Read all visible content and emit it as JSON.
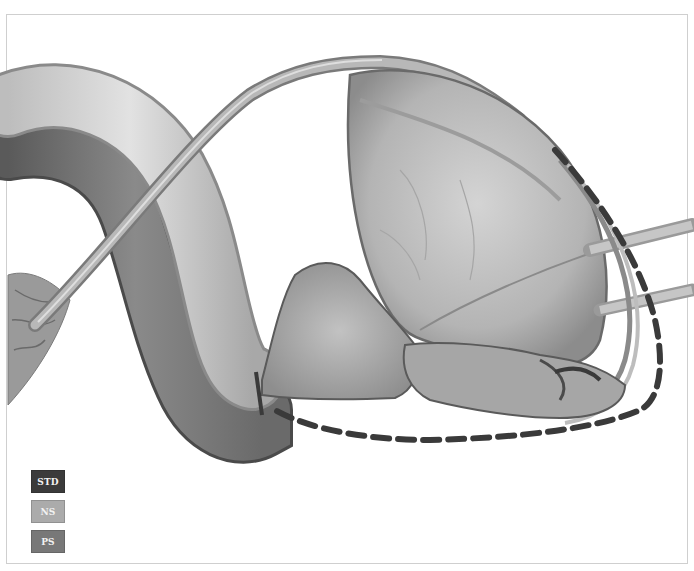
{
  "figure": {
    "dissection_line_color": "#333333"
  },
  "legend": {
    "items": [
      {
        "label": "STD",
        "color": "#3b3b3b"
      },
      {
        "label": "NS",
        "color": "#ababab"
      },
      {
        "label": "PS",
        "color": "#787878"
      }
    ]
  }
}
